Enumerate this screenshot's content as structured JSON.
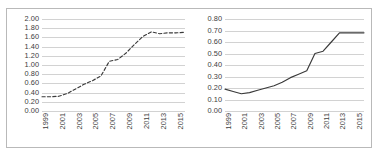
{
  "figure": {
    "border_color": "#b9b9b9",
    "background": "#ffffff",
    "grid_color": "#d2d2d2",
    "line_color": "#3a3a3a"
  },
  "chart_data": [
    {
      "type": "line",
      "title": "",
      "xlabel": "",
      "ylabel": "",
      "ylim": [
        0.0,
        2.0
      ],
      "ytick_step": 0.2,
      "ytick_labels": [
        "0.00",
        "0.20",
        "0.40",
        "0.60",
        "0.80",
        "1.00",
        "1.20",
        "1.40",
        "1.60",
        "1.80",
        "2.00"
      ],
      "grid": true,
      "legend": "none",
      "linestyle": "dashed",
      "xtick_labels": [
        "1999",
        "2001",
        "2003",
        "2005",
        "2007",
        "2009",
        "2011",
        "2013",
        "2015"
      ],
      "x": [
        1999,
        2000,
        2001,
        2002,
        2003,
        2004,
        2005,
        2006,
        2007,
        2008,
        2009,
        2010,
        2011,
        2012,
        2013,
        2014,
        2015,
        2016
      ],
      "values": [
        0.31,
        0.31,
        0.32,
        0.38,
        0.48,
        0.58,
        0.66,
        0.76,
        1.08,
        1.12,
        1.26,
        1.45,
        1.62,
        1.72,
        1.68,
        1.7,
        1.7,
        1.71
      ]
    },
    {
      "type": "line",
      "title": "",
      "xlabel": "",
      "ylabel": "",
      "ylim": [
        0.0,
        0.8
      ],
      "ytick_step": 0.1,
      "ytick_labels": [
        "0.00",
        "0.10",
        "0.20",
        "0.30",
        "0.40",
        "0.50",
        "0.60",
        "0.70",
        "0.80"
      ],
      "grid": true,
      "legend": "none",
      "linestyle": "solid",
      "xtick_labels": [
        "1999",
        "2001",
        "2003",
        "2005",
        "2007",
        "2009",
        "2011",
        "2013",
        "2015"
      ],
      "x": [
        1999,
        2000,
        2001,
        2002,
        2003,
        2004,
        2005,
        2006,
        2007,
        2008,
        2009,
        2010,
        2011,
        2012,
        2013,
        2014,
        2015,
        2016
      ],
      "values": [
        0.19,
        0.17,
        0.15,
        0.16,
        0.18,
        0.2,
        0.22,
        0.25,
        0.29,
        0.32,
        0.35,
        0.5,
        0.52,
        0.6,
        0.68,
        0.68,
        0.68,
        0.68
      ]
    }
  ]
}
